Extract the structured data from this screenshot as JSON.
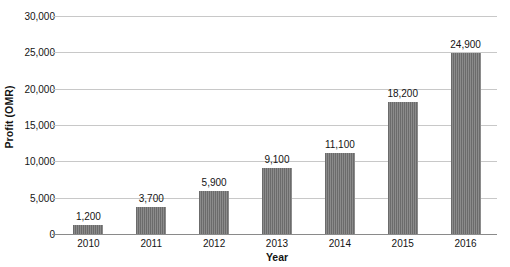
{
  "chart_data": {
    "type": "bar",
    "title": "",
    "subtitle": "",
    "xlabel": "Year",
    "ylabel": "Profit (OMR)",
    "categories": [
      "2010",
      "2011",
      "2012",
      "2013",
      "2014",
      "2015",
      "2016"
    ],
    "values": [
      1200,
      3700,
      5900,
      9100,
      11100,
      18200,
      24900
    ],
    "value_labels": [
      "1,200",
      "3,700",
      "5,900",
      "9,100",
      "11,100",
      "18,200",
      "24,900"
    ],
    "series": [
      {
        "name": "Profit (OMR)",
        "values": [
          1200,
          3700,
          5900,
          9100,
          11100,
          18200,
          24900
        ]
      }
    ],
    "ylim": [
      0,
      30000
    ],
    "ytick_values": [
      0,
      5000,
      10000,
      15000,
      20000,
      25000,
      30000
    ],
    "ytick_labels": [
      "0",
      "5,000",
      "10,000",
      "15,000",
      "20,000",
      "25,000",
      "30,000"
    ],
    "grid": true,
    "legend": false,
    "legend_position": "none",
    "bar_color": "#6b6b6b",
    "gridline_color": "#c8c8c8",
    "background_color": "#ffffff",
    "text_color": "#141414"
  }
}
